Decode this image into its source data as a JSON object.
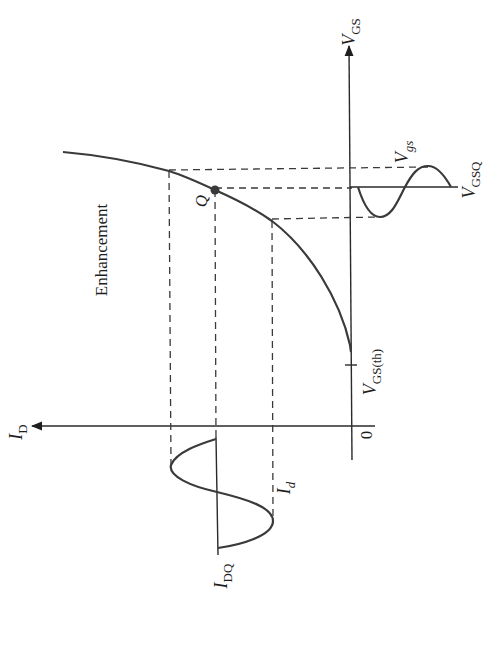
{
  "diagram": {
    "title": "Enhancement",
    "axes": {
      "id_axis": {
        "symbol": "I",
        "subscript": "D"
      },
      "vgs_axis": {
        "symbol": "V",
        "subscript": "GS"
      },
      "origin": "0"
    },
    "labels": {
      "threshold": {
        "symbol": "V",
        "subscript": "GS(th)"
      },
      "q_point": "Q",
      "vgsq": {
        "symbol": "V",
        "subscript": "GSQ"
      },
      "vgs_signal": {
        "symbol": "V",
        "subscript": "gs"
      },
      "idq": {
        "symbol": "I",
        "subscript": "DQ"
      },
      "id_signal": {
        "symbol": "I",
        "subscript": "d"
      }
    },
    "colors": {
      "line": "#3a3a3a",
      "background": "#ffffff"
    }
  }
}
